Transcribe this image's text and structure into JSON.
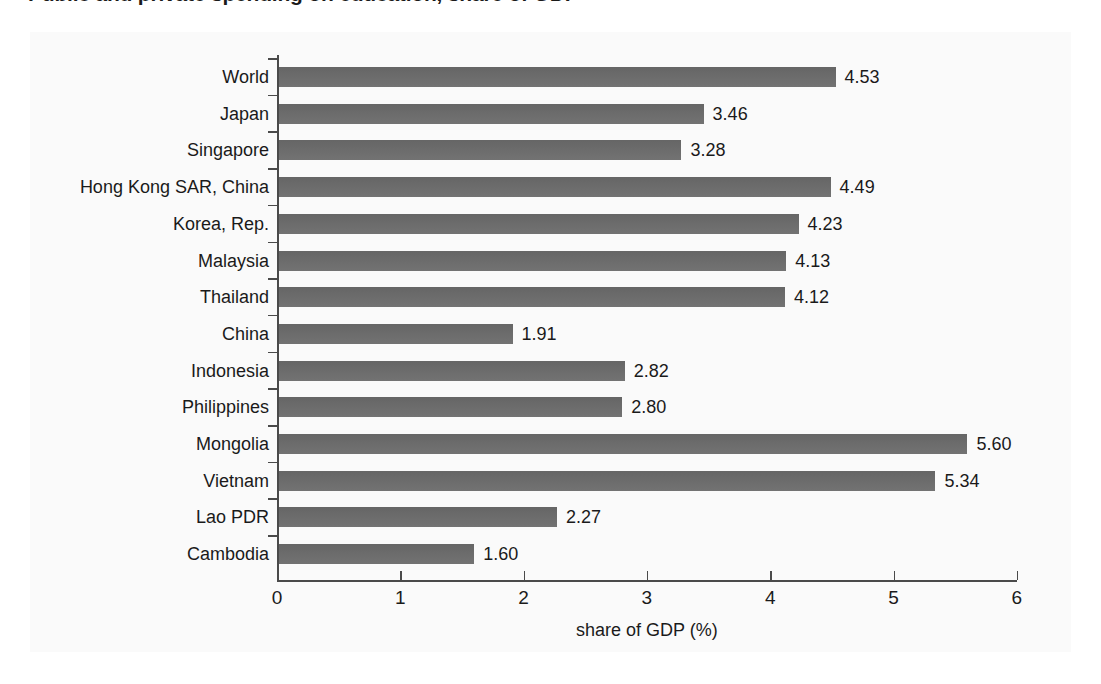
{
  "figure": {
    "title": "Public and private spending on education, share of GDP",
    "background_color": "#fafafa",
    "bar_color": "#6b6b6b",
    "axis_color": "#4a4a4a",
    "text_color": "#1a1a1a"
  },
  "chart_data": {
    "type": "bar",
    "orientation": "horizontal",
    "title": "Public and private spending on education, share of GDP",
    "xlabel": "share of GDP (%)",
    "ylabel": "",
    "xlim": [
      0,
      6
    ],
    "xticks": [
      "0",
      "1",
      "2",
      "3",
      "4",
      "5",
      "6"
    ],
    "grid": false,
    "legend": "none",
    "data_labels": true,
    "categories": [
      "World",
      "Japan",
      "Singapore",
      "Hong Kong SAR, China",
      "Korea, Rep.",
      "Malaysia",
      "Thailand",
      "China",
      "Indonesia",
      "Philippines",
      "Mongolia",
      "Vietnam",
      "Lao PDR",
      "Cambodia"
    ],
    "values": [
      4.53,
      3.46,
      3.28,
      4.49,
      4.23,
      4.13,
      4.12,
      1.91,
      2.82,
      2.8,
      5.6,
      5.34,
      2.27,
      1.6
    ],
    "value_labels": [
      "4.53",
      "3.46",
      "3.28",
      "4.49",
      "4.23",
      "4.13",
      "4.12",
      "1.91",
      "2.82",
      "2.80",
      "5.60",
      "5.34",
      "2.27",
      "1.60"
    ]
  }
}
